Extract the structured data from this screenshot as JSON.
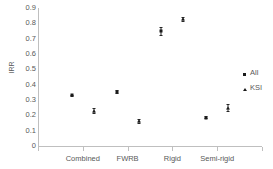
{
  "chart_data": {
    "type": "scatter",
    "title": "",
    "xlabel": "",
    "ylabel": "IRR",
    "categories": [
      "Combined",
      "FWRB",
      "Rigid",
      "Semi-rigid"
    ],
    "ylim": [
      0,
      0.9
    ],
    "ytick_labels": [
      "0.9",
      "0.8",
      "0.7",
      "0.6",
      "0.5",
      "0.4",
      "0.3",
      "0.2",
      "0.1",
      "0"
    ],
    "ytick_values": [
      0.9,
      0.8,
      0.7,
      0.6,
      0.5,
      0.4,
      0.3,
      0.2,
      0.1,
      0
    ],
    "grid": false,
    "legend_position": "right",
    "series": [
      {
        "name": "All",
        "marker": "square",
        "color": "#1a1a1a",
        "values": [
          0.33,
          0.355,
          0.75,
          0.185
        ],
        "err_low": [
          0.325,
          0.345,
          0.725,
          0.18
        ],
        "err_high": [
          0.335,
          0.365,
          0.775,
          0.195
        ]
      },
      {
        "name": "KSI",
        "marker": "triangle",
        "color": "#1a1a1a",
        "values": [
          0.23,
          0.16,
          0.83,
          0.25
        ],
        "err_low": [
          0.215,
          0.15,
          0.815,
          0.225
        ],
        "err_high": [
          0.245,
          0.175,
          0.84,
          0.275
        ]
      }
    ]
  },
  "legend": {
    "items": [
      {
        "label": "All",
        "marker": "square-marker"
      },
      {
        "label": "KSI",
        "marker": "triangle-marker"
      }
    ]
  }
}
